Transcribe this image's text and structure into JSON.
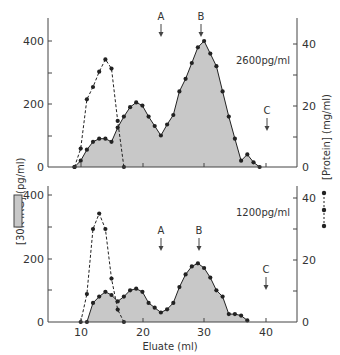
{
  "chart_data": [
    {
      "type": "area",
      "panel": "top",
      "annotation": "2600pg/ml",
      "xlabel": "Eluate (ml)",
      "ylabel_left": "[30K IRG] (pg/ml)",
      "ylabel_right": "[Protein] (mg/ml)",
      "xlim": [
        5,
        45
      ],
      "ylim_left": [
        0,
        480
      ],
      "ylim_right": [
        0,
        48
      ],
      "left_ticks": [
        "0",
        "200",
        "400"
      ],
      "right_ticks": [
        "0",
        "20",
        "40"
      ],
      "markers": [
        {
          "label": "A",
          "x": 23
        },
        {
          "label": "B",
          "x": 29.5
        },
        {
          "label": "C",
          "x": 40
        }
      ],
      "series": [
        {
          "name": "[30K IRG]",
          "style": "shaded solid line",
          "axis": "left",
          "x": [
            9,
            10,
            11,
            12,
            13,
            14,
            15,
            16,
            17,
            18,
            19,
            20,
            21,
            22,
            23,
            24,
            25,
            26,
            27,
            28,
            29,
            30,
            31,
            32,
            33,
            34,
            35,
            36,
            37,
            38,
            39
          ],
          "values": [
            0,
            20,
            55,
            80,
            90,
            90,
            80,
            125,
            160,
            190,
            205,
            195,
            160,
            130,
            100,
            135,
            165,
            240,
            280,
            330,
            380,
            400,
            360,
            320,
            240,
            160,
            90,
            20,
            40,
            15,
            0
          ]
        },
        {
          "name": "[Protein]",
          "style": "dashed line",
          "axis": "right",
          "x": [
            9,
            10,
            11,
            12,
            13,
            14,
            15,
            16,
            17
          ],
          "values": [
            0,
            6,
            22,
            26,
            31,
            35,
            32,
            15,
            0
          ]
        }
      ]
    },
    {
      "type": "area",
      "panel": "bottom",
      "annotation": "1200pg/ml",
      "xlabel": "Eluate (ml)",
      "ylabel_left": "[30K IRG] (pg/ml)",
      "ylabel_right": "[Protein] (mg/ml)",
      "xlim": [
        5,
        45
      ],
      "ylim_left": [
        0,
        440
      ],
      "ylim_right": [
        0,
        44
      ],
      "left_ticks": [
        "0",
        "200",
        "400"
      ],
      "right_ticks": [
        "0",
        "20",
        "40"
      ],
      "x_ticks": [
        "10",
        "20",
        "30",
        "40"
      ],
      "markers": [
        {
          "label": "A",
          "x": 23
        },
        {
          "label": "B",
          "x": 29.5
        },
        {
          "label": "C",
          "x": 40
        }
      ],
      "series": [
        {
          "name": "[30K IRG]",
          "style": "shaded solid line",
          "axis": "left",
          "x": [
            11,
            12,
            13,
            14,
            15,
            16,
            17,
            18,
            19,
            20,
            21,
            22,
            23,
            24,
            25,
            26,
            27,
            28,
            29,
            30,
            31,
            32,
            33,
            34,
            35,
            36,
            37
          ],
          "values": [
            0,
            60,
            80,
            95,
            85,
            65,
            80,
            100,
            105,
            95,
            60,
            45,
            30,
            40,
            60,
            110,
            150,
            175,
            185,
            170,
            140,
            100,
            80,
            25,
            25,
            20,
            5
          ]
        },
        {
          "name": "[Protein]",
          "style": "dashed line",
          "axis": "right",
          "x": [
            10,
            11,
            12,
            13,
            14,
            15,
            16,
            17
          ],
          "values": [
            0,
            9,
            30,
            35,
            30,
            14,
            4,
            0
          ]
        }
      ]
    }
  ],
  "labels": {
    "xlabel": "Eluate (ml)",
    "ylabel_left": "[30K IRG] (pg/ml)",
    "ylabel_right": "[Protein] (mg/ml)",
    "top_annotation": "2600pg/ml",
    "bottom_annotation": "1200pg/ml",
    "marker_a": "A",
    "marker_b": "B",
    "marker_c": "C",
    "tick_0": "0",
    "tick_200": "200",
    "tick_400": "400",
    "tick_r0": "0",
    "tick_r20": "20",
    "tick_r40": "40",
    "x10": "10",
    "x20": "20",
    "x30": "30",
    "x40": "40"
  },
  "colors": {
    "fill": "#c8c8c8",
    "line": "#222222"
  }
}
